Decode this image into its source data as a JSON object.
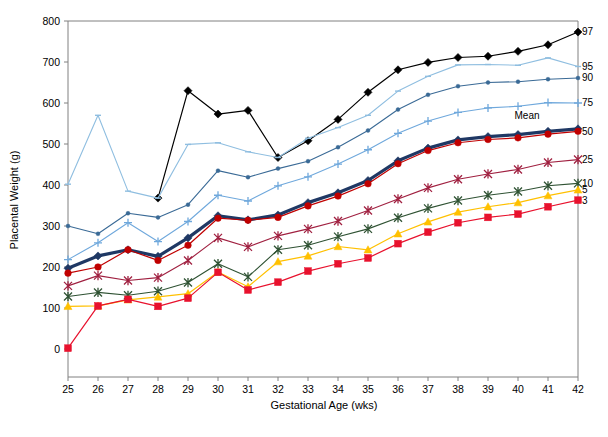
{
  "chart_data": {
    "type": "line",
    "title": "",
    "xlabel": "Gestational Age (wks)",
    "ylabel": "Placental Weight (g)",
    "xlim": [
      25,
      42
    ],
    "ylim": [
      0,
      800
    ],
    "x": [
      25,
      26,
      27,
      28,
      29,
      30,
      31,
      32,
      33,
      34,
      35,
      36,
      37,
      38,
      39,
      40,
      41,
      42
    ],
    "xticks": [
      "25",
      "26",
      "27",
      "28",
      "29",
      "30",
      "31",
      "32",
      "33",
      "34",
      "35",
      "36",
      "37",
      "38",
      "39",
      "40",
      "41",
      "42"
    ],
    "yticks": [
      "0",
      "100",
      "200",
      "300",
      "400",
      "500",
      "600",
      "700",
      "800"
    ],
    "grid": false,
    "legend_position": "right-end-of-line",
    "annotations": [
      {
        "text": "Mean",
        "x": 40.3,
        "y": 560
      }
    ],
    "series": [
      {
        "name": "97",
        "label": "97",
        "color": "#000000",
        "marker": "diamond",
        "marker_size": 4,
        "line_width": 1.2,
        "values": [
          null,
          null,
          null,
          368,
          630,
          573,
          582,
          467,
          508,
          560,
          626,
          681,
          699,
          711,
          714,
          726,
          742,
          773
        ]
      },
      {
        "name": "95",
        "label": "95",
        "color": "#8FBEE0",
        "marker": "dash",
        "marker_size": 3,
        "line_width": 1.1,
        "values": [
          402,
          570,
          385,
          368,
          499,
          503,
          481,
          467,
          514,
          540,
          570,
          629,
          665,
          693,
          694,
          692,
          710,
          689
        ]
      },
      {
        "name": "90",
        "label": "90",
        "color": "#3A6A96",
        "marker": "dot",
        "marker_size": 2,
        "line_width": 1.1,
        "values": [
          300,
          281,
          331,
          321,
          352,
          435,
          419,
          440,
          458,
          492,
          533,
          584,
          620,
          641,
          650,
          652,
          658,
          661
        ]
      },
      {
        "name": "75",
        "label": "75",
        "color": "#6FA8DC",
        "marker": "plus",
        "marker_size": 4,
        "line_width": 1.1,
        "values": [
          218,
          259,
          308,
          262,
          311,
          375,
          361,
          398,
          420,
          451,
          486,
          526,
          556,
          577,
          588,
          592,
          601,
          600
        ]
      },
      {
        "name": "Mean",
        "label": "",
        "color": "#1F3864",
        "marker": "diamond",
        "marker_size": 4,
        "line_width": 3.2,
        "values": [
          197,
          227,
          242,
          226,
          271,
          325,
          315,
          327,
          357,
          381,
          411,
          459,
          490,
          510,
          518,
          523,
          531,
          537
        ]
      },
      {
        "name": "50",
        "label": "50",
        "color": "#C00000",
        "marker": "circle",
        "marker_size": 3.3,
        "line_width": 1.2,
        "values": [
          185,
          200,
          242,
          216,
          253,
          319,
          314,
          321,
          349,
          373,
          403,
          452,
          484,
          503,
          511,
          515,
          524,
          531
        ]
      },
      {
        "name": "25",
        "label": "25",
        "color": "#A02040",
        "marker": "star",
        "marker_size": 4,
        "line_width": 1.1,
        "values": [
          154,
          179,
          167,
          174,
          216,
          271,
          249,
          276,
          293,
          312,
          338,
          366,
          393,
          414,
          427,
          438,
          455,
          462
        ]
      },
      {
        "name": "10",
        "label": "10",
        "color": "#2F5233",
        "marker": "star",
        "marker_size": 4,
        "line_width": 1.1,
        "values": [
          128,
          138,
          131,
          141,
          162,
          208,
          176,
          242,
          253,
          274,
          293,
          320,
          343,
          362,
          375,
          384,
          398,
          404
        ]
      },
      {
        "name": "5",
        "label": "5",
        "color": "#FFC000",
        "marker": "triangle",
        "marker_size": 4,
        "line_width": 1.2,
        "values": [
          104,
          105,
          120,
          127,
          135,
          188,
          152,
          213,
          227,
          250,
          242,
          281,
          310,
          334,
          347,
          357,
          374,
          388
        ]
      },
      {
        "name": "3",
        "label": "3",
        "color": "#E8112D",
        "marker": "square",
        "marker_size": 3.4,
        "line_width": 1.2,
        "values": [
          2,
          105,
          121,
          104,
          124,
          187,
          144,
          163,
          190,
          208,
          222,
          257,
          285,
          308,
          321,
          329,
          347,
          363
        ]
      }
    ]
  },
  "axes": {
    "y_title": "Placental Weight (g)",
    "x_title": "Gestational Age (wks)"
  }
}
